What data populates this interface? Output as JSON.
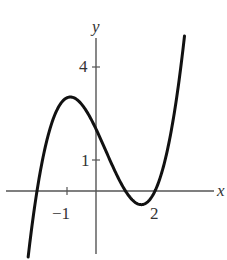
{
  "chart_data": {
    "type": "line",
    "title": "",
    "xlabel": "x",
    "ylabel": "y",
    "xlim": [
      -2.3,
      3.0
    ],
    "ylim": [
      -2.0,
      5.0
    ],
    "grid": false,
    "legend": null,
    "x_ticks": [
      {
        "value": -1,
        "label": "−1"
      },
      {
        "value": 2,
        "label": "2"
      }
    ],
    "y_ticks": [
      {
        "value": 1,
        "label": "1"
      },
      {
        "value": 4,
        "label": "4"
      }
    ],
    "series": [
      {
        "name": "f(x)",
        "description": "cubic with roots at x=-2, 1, 2; local max near (-0.9, 3); y-intercept 2; local min near (1.55, -0.4)",
        "x": [
          -2.3,
          -2.0,
          -1.5,
          -1.0,
          -0.5,
          0.0,
          0.5,
          1.0,
          1.5,
          2.0,
          2.5,
          3.0
        ],
        "y": [
          -1.8,
          0.0,
          2.2,
          3.0,
          2.8,
          2.0,
          1.1,
          0.0,
          -0.4,
          0.0,
          1.1,
          5.0
        ]
      }
    ],
    "key_points": {
      "local_max": [
        -0.9,
        3.0
      ],
      "local_min": [
        1.55,
        -0.4
      ],
      "y_intercept": [
        0,
        2
      ],
      "x_intercepts": [
        -2,
        1,
        2
      ]
    }
  },
  "labels": {
    "x_axis": "x",
    "y_axis": "y",
    "tick_x_neg1": "−1",
    "tick_x_2": "2",
    "tick_y_1": "1",
    "tick_y_4": "4"
  }
}
